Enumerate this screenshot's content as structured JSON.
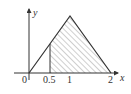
{
  "figure": {
    "axes": {
      "x_label": "x",
      "y_label": "y",
      "origin_label": "0",
      "x_ticks": [
        "0.5",
        "1",
        "2"
      ]
    },
    "shape": {
      "type": "triangle",
      "vertices_x": [
        0,
        1,
        2
      ],
      "shaded_from": 0.5,
      "shaded_to": 2,
      "fill": "hatched"
    },
    "colors": {
      "stroke": "#333333",
      "hatch": "#777777",
      "background": "#ffffff"
    }
  }
}
